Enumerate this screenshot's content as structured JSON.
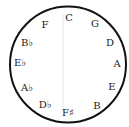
{
  "diagram": {
    "type": "circle-of-fifths",
    "circle": {
      "cx": 68,
      "cy": 64.5,
      "r": 58,
      "stroke": "#111111",
      "stroke_width": 2
    },
    "divider": {
      "x": 63,
      "y1": 14,
      "y2": 112,
      "color": "#e6e6e6"
    },
    "notes": [
      {
        "label": "C",
        "x": 69,
        "y": 18
      },
      {
        "label": "G",
        "x": 95,
        "y": 24
      },
      {
        "label": "D",
        "x": 110,
        "y": 43
      },
      {
        "label": "A",
        "x": 117,
        "y": 64
      },
      {
        "label": "E",
        "x": 112,
        "y": 87
      },
      {
        "label": "B",
        "x": 97,
        "y": 106
      },
      {
        "label": "F♯",
        "x": 68,
        "y": 113
      },
      {
        "label": "D♭",
        "x": 45,
        "y": 105
      },
      {
        "label": "A♭",
        "x": 27,
        "y": 88
      },
      {
        "label": "E♭",
        "x": 20,
        "y": 63
      },
      {
        "label": "B♭",
        "x": 27,
        "y": 43
      },
      {
        "label": "F",
        "x": 45,
        "y": 25
      }
    ]
  }
}
